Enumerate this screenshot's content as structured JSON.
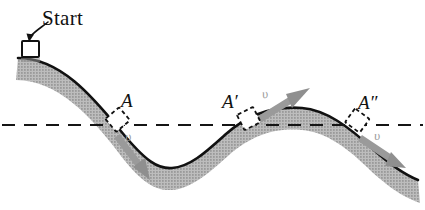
{
  "figure": {
    "background_color": "#ffffff",
    "width": 425,
    "height": 210
  },
  "colors": {
    "track_outline": "#111111",
    "track_fill": "#b2b2b2",
    "reference_line": "#151515",
    "velocity_arrow": "#9a9a9a",
    "block_outline": "#111111",
    "block_fill": "#ffffff",
    "label_text": "#111111",
    "speed_label_text": "#9a9a9a"
  },
  "labels": {
    "start": "Start",
    "point_a": "A",
    "point_a_prime": "A′",
    "point_a_double_prime": "A″",
    "speed_at_a": "υ",
    "speed_at_a_prime": "υ",
    "speed_at_a_double_prime": "υ"
  },
  "annotations": {
    "start_arrow": "start-pointer-arrow",
    "reference_line_style": "dashed",
    "blocks": [
      {
        "name": "start-block",
        "style": "solid",
        "label": "Start"
      },
      {
        "name": "block-at-a",
        "style": "dashed",
        "label": "A"
      },
      {
        "name": "block-at-a-prime",
        "style": "dashed",
        "label": "A′"
      },
      {
        "name": "block-at-a-double-prime",
        "style": "dashed",
        "label": "A″"
      }
    ],
    "velocity_arrows": [
      {
        "name": "velocity-arrow-a",
        "direction": "down-right",
        "label": "υ"
      },
      {
        "name": "velocity-arrow-a-prime",
        "direction": "up-right",
        "label": "υ"
      },
      {
        "name": "velocity-arrow-a-double-prime",
        "direction": "down-right",
        "label": "υ"
      }
    ]
  },
  "geometry": {
    "reference_line_y": 125,
    "track_top_path": "M 18 58 C 60 58 92 96 120 130 C 146 162 158 169 172 168 C 190 167 206 152 226 134 C 252 111 278 106 302 108 C 326 110 348 126 374 150 C 394 168 408 176 418 180",
    "track_thickness": 22,
    "points": [
      {
        "name": "A",
        "x": 118,
        "y": 126
      },
      {
        "name": "A'",
        "x": 250,
        "y": 126
      },
      {
        "name": "A''",
        "x": 358,
        "y": 136
      }
    ]
  }
}
